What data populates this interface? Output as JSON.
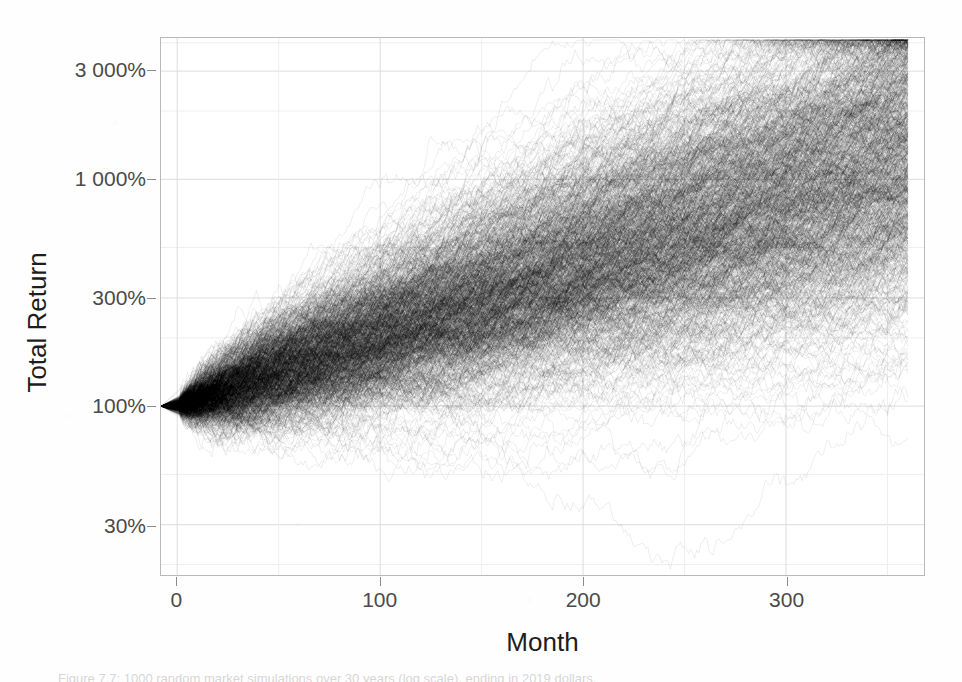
{
  "figure": {
    "caption": "Figure 7.7: 1000 random market simulations over 30 years (log scale), ending in 2019 dollars."
  },
  "axes": {
    "x_title": "Month",
    "y_title": "Total Return",
    "x_ticks": [
      {
        "label": "0",
        "value": 0
      },
      {
        "label": "100",
        "value": 100
      },
      {
        "label": "200",
        "value": 200
      },
      {
        "label": "300",
        "value": 300
      }
    ],
    "y_ticks": [
      {
        "label": "3 000%",
        "value": 3000
      },
      {
        "label": "1 000%",
        "value": 1000
      },
      {
        "label": "300%",
        "value": 300
      },
      {
        "label": "100%",
        "value": 100
      },
      {
        "label": "30%",
        "value": 30
      }
    ]
  },
  "style": {
    "panel_background": "#ffffff",
    "panel_border": "#b9b9b9",
    "major_gridline": "#dcdcdc",
    "minor_gridline": "#eeeeee",
    "line_color": "#000000",
    "tick_label_color": "#4a4a4a",
    "axis_title_color": "#1d1d1d"
  },
  "chart_data": {
    "type": "line",
    "title": "",
    "subtitle": "",
    "xlabel": "Month",
    "ylabel": "Total Return",
    "xlim": [
      -8,
      368
    ],
    "ylim": [
      18,
      4200
    ],
    "yscale": "log",
    "xscale": "linear",
    "grid": true,
    "legend": null,
    "legend_position": "none",
    "n_series": 1000,
    "series_description": "1000 overlaid Monte Carlo random-walk paths of cumulative total return, all starting at 100% at month 0, drawn in semi-transparent black so overplotting density reads as shading.",
    "x": [
      0,
      30,
      60,
      90,
      120,
      150,
      180,
      210,
      240,
      270,
      300,
      330,
      360
    ],
    "annotations": [
      "All paths originate from a single point at (month 0, 100%).",
      "The dispersion fan widens monotonically with time.",
      "Densest (near-black) core tracks the median path.",
      "Two faint outlier paths rise above 2 000% near month 350."
    ],
    "quantile_bands": {
      "description": "Approximate total-return percentiles read off the log axis at each sampled month.",
      "months": [
        0,
        30,
        60,
        90,
        120,
        150,
        180,
        210,
        240,
        270,
        300,
        330,
        360
      ],
      "p01": [
        100,
        48,
        45,
        52,
        60,
        70,
        82,
        96,
        112,
        130,
        150,
        168,
        185
      ],
      "p05": [
        100,
        62,
        66,
        78,
        92,
        110,
        132,
        158,
        188,
        222,
        262,
        300,
        340
      ],
      "p25": [
        100,
        86,
        100,
        122,
        150,
        184,
        226,
        276,
        338,
        412,
        500,
        596,
        700
      ],
      "p50": [
        100,
        101,
        126,
        158,
        200,
        252,
        318,
        400,
        503,
        632,
        795,
        980,
        1190
      ],
      "p75": [
        100,
        118,
        158,
        206,
        268,
        348,
        452,
        586,
        760,
        984,
        1270,
        1600,
        1980
      ],
      "p95": [
        100,
        148,
        218,
        302,
        416,
        570,
        782,
        1060,
        1420,
        1900,
        2480,
        2960,
        3000
      ],
      "p99": [
        100,
        168,
        262,
        378,
        540,
        760,
        1060,
        1460,
        1980,
        2560,
        2900,
        3050,
        3060
      ]
    },
    "notable_points": [
      {
        "label": "common origin",
        "month": 0,
        "value": 100
      },
      {
        "label": "lowest excursion",
        "month": 38,
        "value": 22
      },
      {
        "label": "early high path",
        "month": 95,
        "value": 660
      },
      {
        "label": "peak outlier",
        "month": 352,
        "value": 3050
      },
      {
        "label": "median endpoint",
        "month": 360,
        "value": 1190
      }
    ]
  }
}
